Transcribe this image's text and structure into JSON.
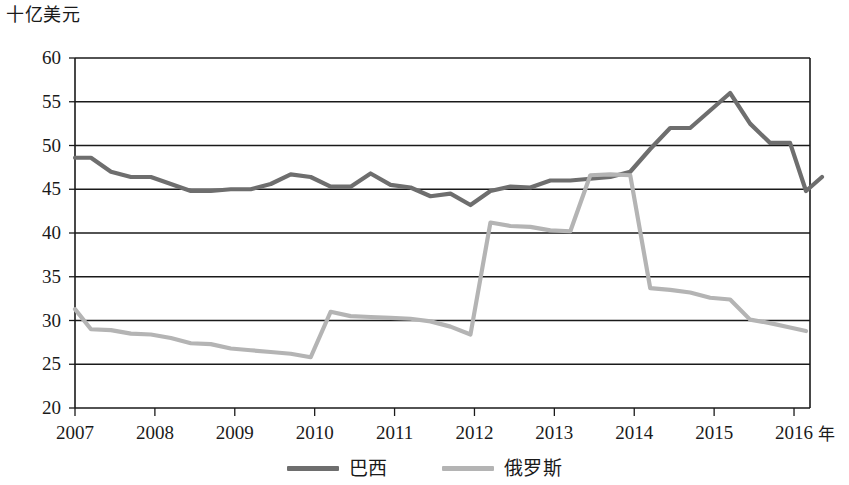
{
  "chart_data": {
    "type": "line",
    "title": "",
    "ylabel": "十亿美元",
    "xlabel": "年",
    "ylim": [
      20,
      60
    ],
    "xlim": [
      2007,
      2016.2
    ],
    "yticks": [
      20,
      25,
      30,
      35,
      40,
      45,
      50,
      55,
      60
    ],
    "xticks": [
      2007,
      2008,
      2009,
      2010,
      2011,
      2012,
      2013,
      2014,
      2015,
      2016
    ],
    "ytick_labels": [
      "20",
      "25",
      "30",
      "35",
      "40",
      "45",
      "50",
      "55",
      "60"
    ],
    "xtick_labels": [
      "2007",
      "2008",
      "2009",
      "2010",
      "2011",
      "2012",
      "2013",
      "2014",
      "2015",
      "2016"
    ],
    "grid": "horizontal",
    "legend_position": "bottom",
    "series": [
      {
        "name": "巴西",
        "color": "#6e6e6e",
        "x": [
          2007.0,
          2007.2,
          2007.45,
          2007.7,
          2007.95,
          2008.2,
          2008.45,
          2008.7,
          2008.95,
          2009.2,
          2009.45,
          2009.7,
          2009.95,
          2010.2,
          2010.45,
          2010.7,
          2010.95,
          2011.2,
          2011.45,
          2011.7,
          2011.95,
          2012.2,
          2012.45,
          2012.7,
          2012.95,
          2013.2,
          2013.45,
          2013.7,
          2013.95,
          2014.2,
          2014.45,
          2014.7,
          2014.95,
          2015.2,
          2015.45,
          2015.7,
          2015.95,
          2016.15
        ],
        "values": [
          48.6,
          48.6,
          47.0,
          46.4,
          46.4,
          45.6,
          44.8,
          44.8,
          45.0,
          45.0,
          45.6,
          46.7,
          46.4,
          45.3,
          45.3,
          46.8,
          45.5,
          45.2,
          44.2,
          44.5,
          43.2,
          44.8,
          45.3,
          45.2,
          46.0,
          46.0,
          46.2,
          46.4,
          47.0,
          49.6,
          52.0,
          52.0,
          54.0,
          56.0,
          52.5,
          50.3,
          50.3,
          44.8
        ]
      },
      {
        "name": "俄罗斯",
        "color": "#b4b4b4",
        "x": [
          2007.0,
          2007.2,
          2007.45,
          2007.7,
          2007.95,
          2008.2,
          2008.45,
          2008.7,
          2008.95,
          2009.2,
          2009.45,
          2009.7,
          2009.95,
          2010.2,
          2010.45,
          2010.7,
          2010.95,
          2011.2,
          2011.45,
          2011.7,
          2011.95,
          2012.2,
          2012.45,
          2012.7,
          2012.95,
          2013.2,
          2013.45,
          2013.7,
          2013.95,
          2014.2,
          2014.45,
          2014.7,
          2014.95,
          2015.2,
          2015.45,
          2015.7,
          2015.95,
          2016.15
        ],
        "values": [
          31.3,
          29.0,
          28.9,
          28.5,
          28.4,
          28.0,
          27.4,
          27.3,
          26.8,
          26.6,
          26.4,
          26.2,
          25.8,
          31.0,
          30.5,
          30.4,
          30.3,
          30.2,
          29.9,
          29.3,
          28.4,
          41.2,
          40.8,
          40.7,
          40.3,
          40.2,
          46.6,
          46.7,
          46.6,
          33.7,
          33.5,
          33.2,
          32.6,
          32.4,
          30.1,
          29.7,
          29.2,
          28.8
        ]
      }
    ],
    "brazil_tail": {
      "x": [
        2016.15,
        2016.35
      ],
      "values": [
        44.8,
        46.4
      ]
    }
  },
  "axis": {
    "y_title": "十亿美元",
    "x_unit": "年"
  },
  "legend": {
    "items": [
      {
        "label": "巴西",
        "color": "#6e6e6e"
      },
      {
        "label": "俄罗斯",
        "color": "#b4b4b4"
      }
    ]
  },
  "colors": {
    "brazil": "#6e6e6e",
    "russia": "#b4b4b4",
    "axis": "#1a1a1a",
    "grid": "#1a1a1a",
    "background": "#ffffff"
  }
}
